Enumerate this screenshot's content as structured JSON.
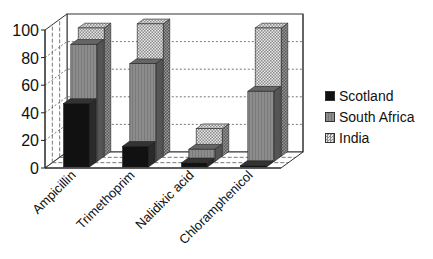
{
  "chart_data": {
    "type": "bar",
    "variant": "3d-series-depth",
    "title": "",
    "xlabel": "",
    "ylabel": "",
    "ylim": [
      0,
      100
    ],
    "yticks": [
      0,
      20,
      40,
      60,
      80,
      100
    ],
    "grid": true,
    "legend_position": "right",
    "categories": [
      "Ampicillin",
      "Trimethoprim",
      "Nalidixic acid",
      "Chloramphenicol"
    ],
    "series": [
      {
        "name": "Scotland",
        "values": [
          46,
          15,
          3,
          1
        ],
        "color": "#111111",
        "pattern": "solid"
      },
      {
        "name": "South Africa",
        "values": [
          85,
          71,
          9,
          51
        ],
        "color": "#8a8a8a",
        "pattern": "vertical-lines"
      },
      {
        "name": "India",
        "values": [
          93,
          96,
          20,
          93
        ],
        "color": "#cfcfcf",
        "pattern": "checker"
      }
    ]
  },
  "legend": {
    "items": [
      {
        "label": "Scotland"
      },
      {
        "label": "South Africa"
      },
      {
        "label": "India"
      }
    ]
  },
  "axis": {
    "tick_labels": [
      "0",
      "20",
      "40",
      "60",
      "80",
      "100"
    ]
  }
}
